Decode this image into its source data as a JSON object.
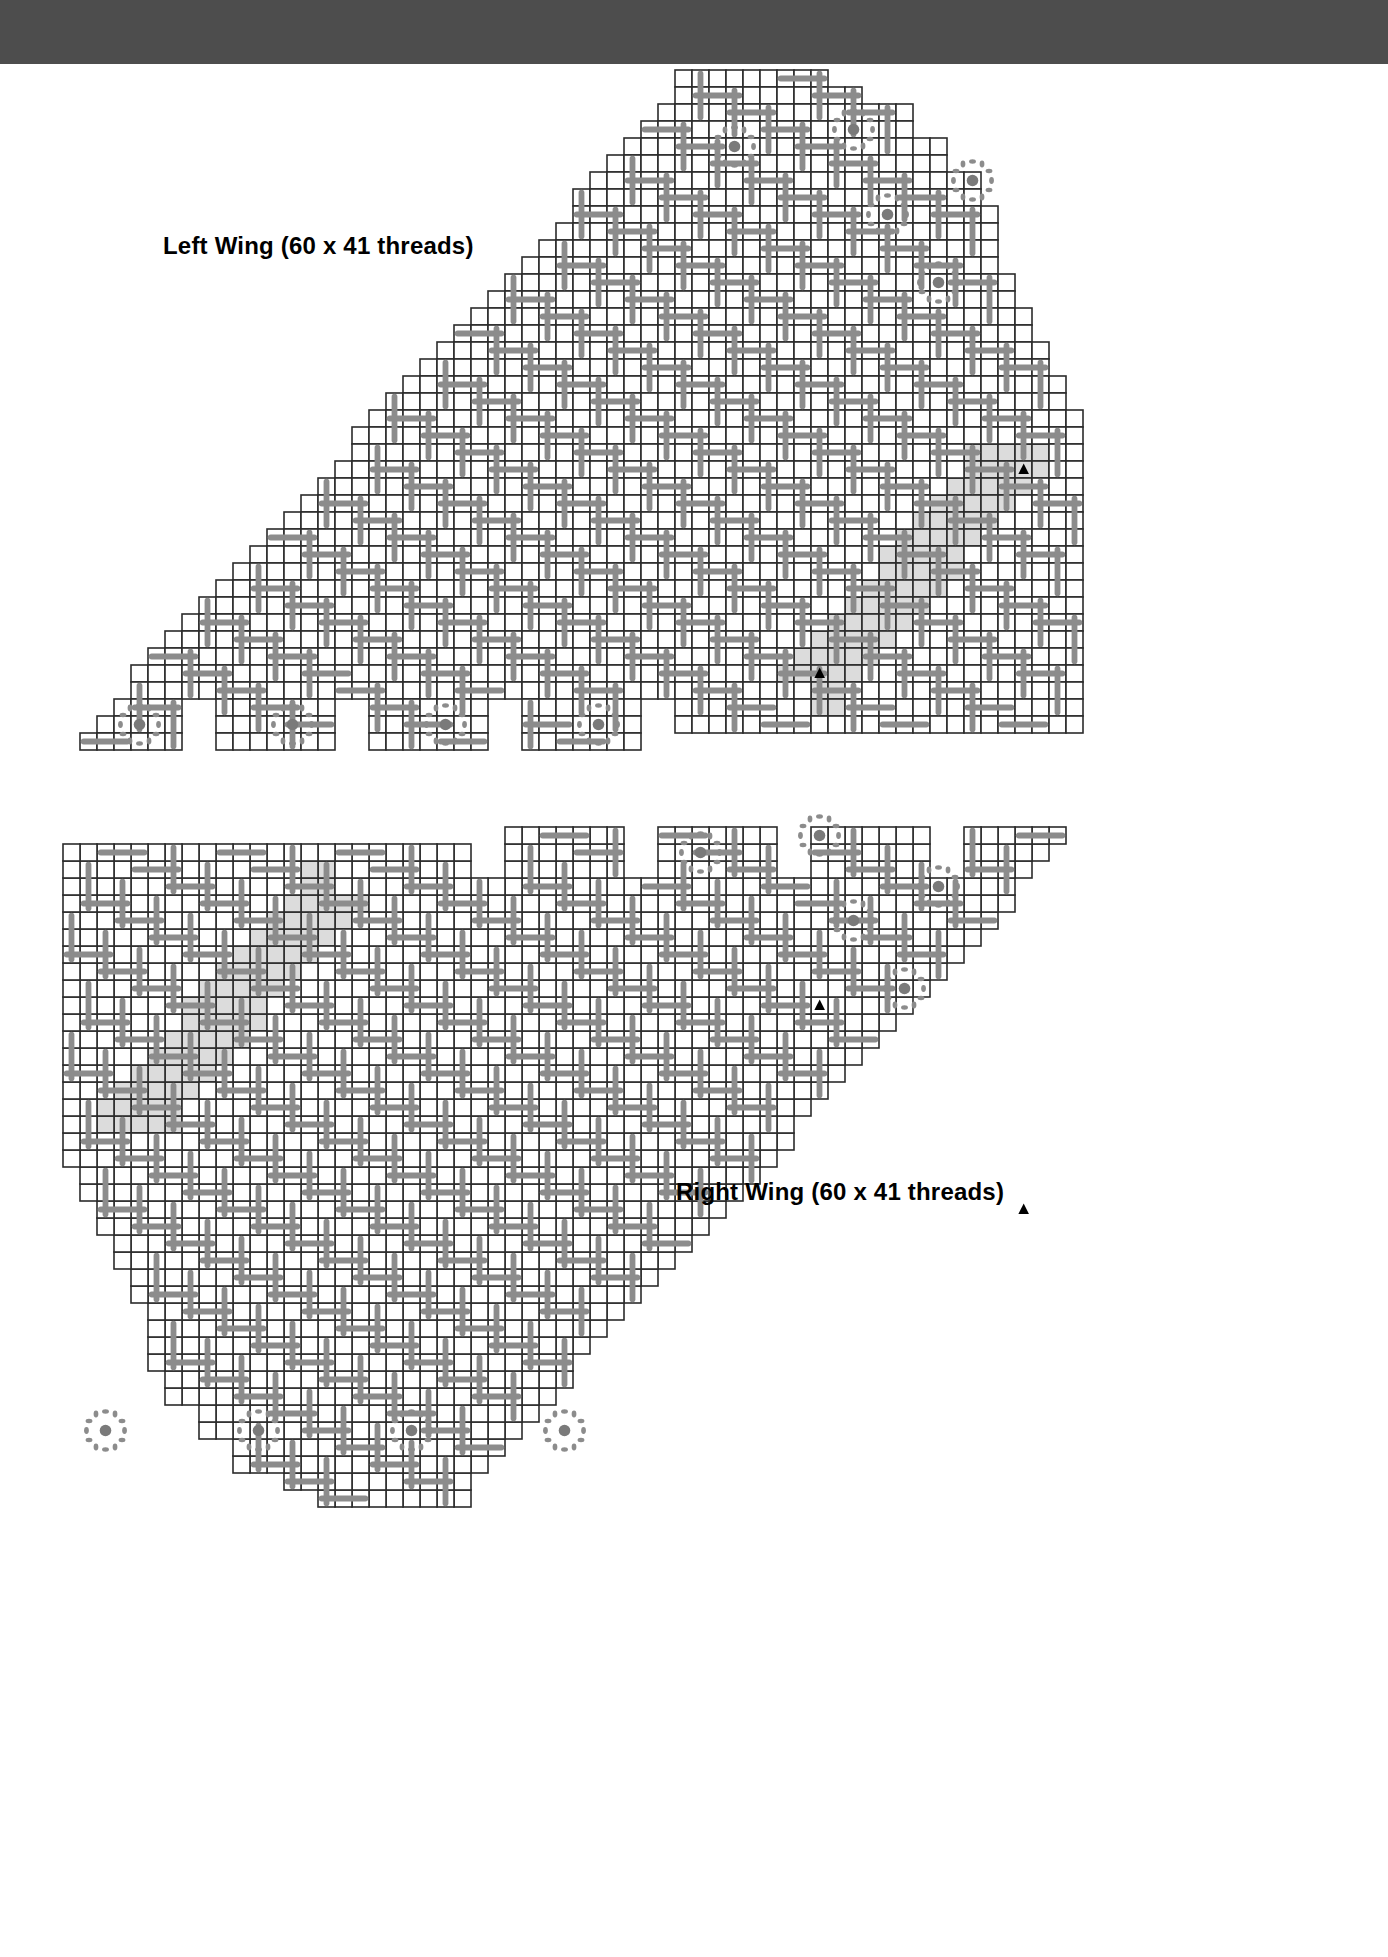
{
  "document": {
    "kind": "needlework-pattern-chart",
    "banner": {
      "color": "#4d4d4d",
      "label": ""
    }
  },
  "palette": {
    "banner": "#4d4d4d",
    "grid_line": "#2b2b2b",
    "cell_fill": "#ffffff",
    "stitch": "#8c8c8c",
    "repeat_shade": "#dcdcdc",
    "marker": "#000000",
    "text": "#000000"
  },
  "charts": [
    {
      "id": "left-wing",
      "title": "Left Wing (60 x 41 threads)",
      "threads_wide": 60,
      "threads_high": 41,
      "orientation": "left",
      "title_position": {
        "x": 163,
        "y": 232
      },
      "origin": {
        "x": 63,
        "y": 70
      },
      "cell": 17,
      "markers": [
        {
          "name": "repeat-marker-top",
          "col": 56,
          "row": 23
        },
        {
          "name": "repeat-marker-bottom",
          "col": 44,
          "row": 35
        }
      ],
      "eyelets": [
        {
          "col": 3,
          "row": 37
        },
        {
          "col": 12,
          "row": 37
        },
        {
          "col": 21,
          "row": 37
        },
        {
          "col": 30,
          "row": 37
        },
        {
          "col": 38,
          "row": 3
        },
        {
          "col": 45,
          "row": 2
        },
        {
          "col": 47,
          "row": 7
        },
        {
          "col": 52,
          "row": 5
        },
        {
          "col": 50,
          "row": 11
        }
      ]
    },
    {
      "id": "right-wing",
      "title": "Right Wing (60 x 41 threads)",
      "threads_wide": 60,
      "threads_high": 41,
      "orientation": "right",
      "title_position": {
        "x": 676,
        "y": 1178
      },
      "origin": {
        "x": 63,
        "y": 810
      },
      "cell": 17,
      "markers": [
        {
          "name": "repeat-marker-left",
          "col": 3,
          "row": 17
        },
        {
          "name": "repeat-marker-bottom",
          "col": 15,
          "row": 29
        }
      ],
      "eyelets": [
        {
          "col": 56,
          "row": 3
        },
        {
          "col": 47,
          "row": 3
        },
        {
          "col": 38,
          "row": 3
        },
        {
          "col": 29,
          "row": 3
        },
        {
          "col": 21,
          "row": 37
        },
        {
          "col": 14,
          "row": 38
        },
        {
          "col": 12,
          "row": 33
        },
        {
          "col": 7,
          "row": 35
        },
        {
          "col": 9,
          "row": 29
        }
      ]
    }
  ],
  "legend": {
    "stitch_symbol": "long-stitch-bar",
    "eyelet_symbol": "eyelet-motif",
    "repeat_symbol": "repeat-triangle"
  }
}
